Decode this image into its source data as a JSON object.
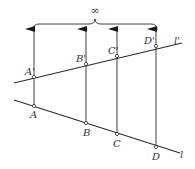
{
  "diagram": {
    "title_symbol": "∞",
    "colors": {
      "stroke": "#2a2a2a",
      "text": "#333333",
      "background": "#ffffff"
    },
    "lines": [
      {
        "name": "l_prime",
        "label": "l'"
      },
      {
        "name": "l",
        "label": "l"
      }
    ],
    "points_upper": [
      {
        "label": "A'"
      },
      {
        "label": "B'"
      },
      {
        "label": "C'"
      },
      {
        "label": "D'"
      }
    ],
    "points_lower": [
      {
        "label": "A"
      },
      {
        "label": "B"
      },
      {
        "label": "C"
      },
      {
        "label": "D"
      }
    ]
  }
}
